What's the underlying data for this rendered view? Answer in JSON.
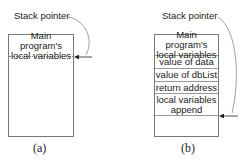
{
  "diagram_a": {
    "pointer_label": "Stack pointer",
    "cells": [
      "Main program's\nlocal variables"
    ],
    "caption": "(a)"
  },
  "diagram_b": {
    "pointer_label": "Stack pointer",
    "cells": [
      "Main program's\nlocal variables",
      "value of data",
      "value of dbList",
      "return address",
      "local variables\nappend"
    ],
    "caption": "(b)"
  }
}
